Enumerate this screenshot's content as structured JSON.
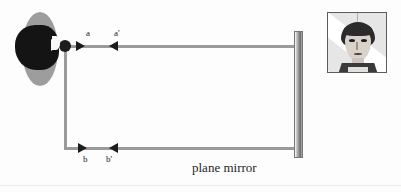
{
  "figure": {
    "type": "optics-ray-diagram",
    "caption_mirror": "plane mirror",
    "background_color": "#fdfdfd",
    "ray_color": "#9a9a9a",
    "arrow_color": "#1b1b1b"
  },
  "labels": {
    "a": "a",
    "a_prime": "a'",
    "b": "b",
    "b_prime": "b'"
  },
  "elements": {
    "observer_name": "observer-head",
    "object_dot_name": "point-object",
    "mirror_name": "plane-mirror-bar",
    "portrait_name": "reflected-face-photo"
  },
  "geometry": {
    "object_dot": {
      "x": 65,
      "y": 46
    },
    "mirror": {
      "x": 298,
      "y_top": 31,
      "y_bottom": 158
    },
    "upper_ray": {
      "y": 46,
      "x_start": 65,
      "x_end": 296
    },
    "lower_ray": {
      "y": 148,
      "x_start": 66,
      "x_end": 296
    },
    "vertical_ray": {
      "x": 65,
      "y_start": 46,
      "y_end": 148
    }
  },
  "arrows": [
    {
      "name": "arrow-a",
      "direction": "right",
      "x": 80,
      "y": 46,
      "label": "a"
    },
    {
      "name": "arrow-a-prime",
      "direction": "left",
      "x": 113,
      "y": 46,
      "label": "a'"
    },
    {
      "name": "arrow-b",
      "direction": "right",
      "x": 82,
      "y": 148,
      "label": "b"
    },
    {
      "name": "arrow-b-prime",
      "direction": "left",
      "x": 113,
      "y": 148,
      "label": "b'"
    }
  ]
}
